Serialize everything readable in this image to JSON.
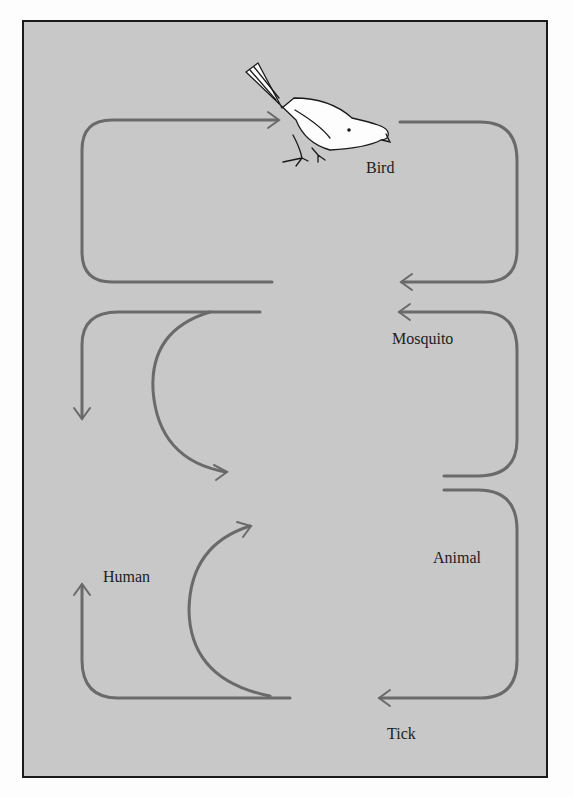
{
  "diagram": {
    "title": "",
    "colors": {
      "background": "#c8c8c8",
      "border": "#1a1a1a",
      "arrow": "#6a6a6a",
      "human": "#5a5a5a"
    },
    "nodes": [
      {
        "id": "bird",
        "label": "Bird",
        "icon": "bird-icon"
      },
      {
        "id": "mosquito",
        "label": "Mosquito",
        "icon": "mosquito-icon"
      },
      {
        "id": "human",
        "label": "Human",
        "icon": "human-icon"
      },
      {
        "id": "animal",
        "label": "Animal",
        "icon": "horse-icon"
      },
      {
        "id": "tick",
        "label": "Tick",
        "icon": "tick-icon"
      }
    ],
    "edges": [
      {
        "from": "mosquito",
        "to": "bird"
      },
      {
        "from": "bird",
        "to": "mosquito"
      },
      {
        "from": "mosquito",
        "to": "human"
      },
      {
        "from": "mosquito",
        "to": "animal"
      },
      {
        "from": "animal",
        "to": "mosquito"
      },
      {
        "from": "animal",
        "to": "tick"
      },
      {
        "from": "tick",
        "to": "animal"
      },
      {
        "from": "tick",
        "to": "human"
      }
    ]
  }
}
